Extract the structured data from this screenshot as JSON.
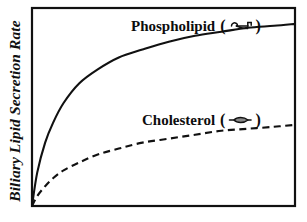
{
  "figure": {
    "background_color": "#ffffff",
    "frame_color": "#111111",
    "line_color": "#111111"
  },
  "axes": {
    "y_title": "Biliary Lipid Secretion Rate",
    "x_title": "",
    "y_ticks": [],
    "x_ticks": [],
    "grid": "off",
    "frame": "box"
  },
  "legend": {
    "position": "inline-annotations",
    "entries": [
      {
        "label": "Phospholipid",
        "open_paren": "(",
        "close_paren": ")",
        "glyph_name": "phospholipid-molecule-icon",
        "line_style": "solid"
      },
      {
        "label": "Cholesterol",
        "open_paren": "(",
        "close_paren": ")",
        "glyph_name": "cholesterol-molecule-icon",
        "line_style": "dashed"
      }
    ]
  },
  "chart_data": {
    "type": "line",
    "title": "",
    "subtitle": "",
    "xlabel": "",
    "ylabel": "Biliary Lipid Secretion Rate",
    "xlim": [
      0,
      100
    ],
    "ylim": [
      0,
      100
    ],
    "grid": false,
    "axis_ticks": "none",
    "legend_position": "inline-annotations",
    "annotations": [
      {
        "text": "Phospholipid",
        "x": 38,
        "y": 93,
        "glyph": "phospholipid-molecule-icon"
      },
      {
        "text": "Cholesterol",
        "x": 43,
        "y": 46,
        "glyph": "cholesterol-molecule-icon"
      }
    ],
    "x": [
      0,
      2,
      5,
      8,
      12,
      18,
      25,
      33,
      42,
      52,
      62,
      72,
      82,
      92,
      100
    ],
    "series": [
      {
        "name": "Phospholipid",
        "style": "solid",
        "color": "#111111",
        "values": [
          0,
          17,
          32,
          42,
          52,
          62,
          69,
          75,
          79,
          83,
          86,
          88,
          90,
          91,
          92
        ]
      },
      {
        "name": "Cholesterol",
        "style": "dashed",
        "color": "#111111",
        "values": [
          0,
          5,
          10,
          14,
          18,
          22,
          26,
          29,
          32,
          34,
          36,
          38,
          39,
          40,
          41
        ]
      }
    ]
  }
}
